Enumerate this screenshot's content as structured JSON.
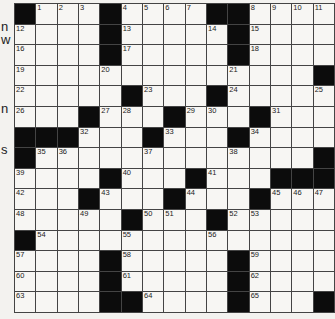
{
  "puzzle": {
    "size": {
      "rows": 15,
      "cols": 15
    },
    "margin_fragments": [
      {
        "text": "n",
        "top": 20
      },
      {
        "text": "w",
        "top": 33
      },
      {
        "text": "n",
        "top": 102
      },
      {
        "text": "s",
        "top": 143
      }
    ],
    "rows": [
      "#...#....##....",
      "....#.....#....",
      "....#.....#....",
      "..............#",
      ".....#...#.....",
      "...#...#...#...",
      "###...#...#....",
      "#.............#",
      "....#...#...###",
      "...#...#...#...",
      ".....#...#.....",
      "#..............",
      "....#.....#....",
      "....#.....#....",
      "....##....#...#"
    ],
    "numbers": [
      {
        "r": 0,
        "c": 1,
        "n": "1"
      },
      {
        "r": 0,
        "c": 2,
        "n": "2"
      },
      {
        "r": 0,
        "c": 3,
        "n": "3"
      },
      {
        "r": 0,
        "c": 5,
        "n": "4"
      },
      {
        "r": 0,
        "c": 6,
        "n": "5"
      },
      {
        "r": 0,
        "c": 7,
        "n": "6"
      },
      {
        "r": 0,
        "c": 8,
        "n": "7"
      },
      {
        "r": 0,
        "c": 11,
        "n": "8"
      },
      {
        "r": 0,
        "c": 12,
        "n": "9"
      },
      {
        "r": 0,
        "c": 13,
        "n": "10"
      },
      {
        "r": 0,
        "c": 14,
        "n": "11"
      },
      {
        "r": 1,
        "c": 0,
        "n": "12"
      },
      {
        "r": 1,
        "c": 5,
        "n": "13"
      },
      {
        "r": 1,
        "c": 9,
        "n": "14"
      },
      {
        "r": 1,
        "c": 11,
        "n": "15"
      },
      {
        "r": 2,
        "c": 0,
        "n": "16"
      },
      {
        "r": 2,
        "c": 5,
        "n": "17"
      },
      {
        "r": 2,
        "c": 11,
        "n": "18"
      },
      {
        "r": 3,
        "c": 0,
        "n": "19"
      },
      {
        "r": 3,
        "c": 4,
        "n": "20"
      },
      {
        "r": 3,
        "c": 10,
        "n": "21"
      },
      {
        "r": 4,
        "c": 0,
        "n": "22"
      },
      {
        "r": 4,
        "c": 6,
        "n": "23"
      },
      {
        "r": 4,
        "c": 10,
        "n": "24"
      },
      {
        "r": 4,
        "c": 14,
        "n": "25"
      },
      {
        "r": 5,
        "c": 0,
        "n": "26"
      },
      {
        "r": 5,
        "c": 4,
        "n": "27"
      },
      {
        "r": 5,
        "c": 5,
        "n": "28"
      },
      {
        "r": 5,
        "c": 8,
        "n": "29"
      },
      {
        "r": 5,
        "c": 9,
        "n": "30"
      },
      {
        "r": 5,
        "c": 12,
        "n": "31"
      },
      {
        "r": 6,
        "c": 3,
        "n": "32"
      },
      {
        "r": 6,
        "c": 7,
        "n": "33"
      },
      {
        "r": 6,
        "c": 11,
        "n": "34"
      },
      {
        "r": 7,
        "c": 1,
        "n": "35"
      },
      {
        "r": 7,
        "c": 2,
        "n": "36"
      },
      {
        "r": 7,
        "c": 6,
        "n": "37"
      },
      {
        "r": 7,
        "c": 10,
        "n": "38"
      },
      {
        "r": 8,
        "c": 0,
        "n": "39"
      },
      {
        "r": 8,
        "c": 5,
        "n": "40"
      },
      {
        "r": 8,
        "c": 9,
        "n": "41"
      },
      {
        "r": 9,
        "c": 0,
        "n": "42"
      },
      {
        "r": 9,
        "c": 4,
        "n": "43"
      },
      {
        "r": 9,
        "c": 8,
        "n": "44"
      },
      {
        "r": 9,
        "c": 12,
        "n": "45"
      },
      {
        "r": 9,
        "c": 13,
        "n": "46"
      },
      {
        "r": 9,
        "c": 14,
        "n": "47"
      },
      {
        "r": 10,
        "c": 0,
        "n": "48"
      },
      {
        "r": 10,
        "c": 3,
        "n": "49"
      },
      {
        "r": 10,
        "c": 6,
        "n": "50"
      },
      {
        "r": 10,
        "c": 7,
        "n": "51"
      },
      {
        "r": 10,
        "c": 10,
        "n": "52"
      },
      {
        "r": 10,
        "c": 11,
        "n": "53"
      },
      {
        "r": 11,
        "c": 1,
        "n": "54"
      },
      {
        "r": 11,
        "c": 5,
        "n": "55"
      },
      {
        "r": 11,
        "c": 9,
        "n": "56"
      },
      {
        "r": 12,
        "c": 0,
        "n": "57"
      },
      {
        "r": 12,
        "c": 5,
        "n": "58"
      },
      {
        "r": 12,
        "c": 11,
        "n": "59"
      },
      {
        "r": 13,
        "c": 0,
        "n": "60"
      },
      {
        "r": 13,
        "c": 5,
        "n": "61"
      },
      {
        "r": 13,
        "c": 11,
        "n": "62"
      },
      {
        "r": 14,
        "c": 0,
        "n": "63"
      },
      {
        "r": 14,
        "c": 6,
        "n": "64"
      },
      {
        "r": 14,
        "c": 11,
        "n": "65"
      }
    ]
  }
}
